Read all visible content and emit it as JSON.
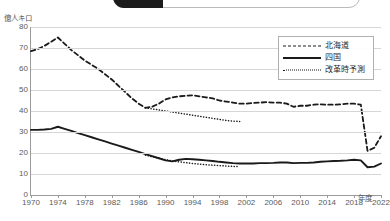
{
  "toolbar": {
    "active_chip_label": "",
    "chips": []
  },
  "chart_data": {
    "type": "line",
    "title": "",
    "xlabel": "年度",
    "ylabel": "億人キロ",
    "grid": true,
    "legend_position": "top-right",
    "xlim": [
      1970,
      2022
    ],
    "ylim": [
      0,
      80
    ],
    "yticks": [
      0,
      10,
      20,
      30,
      40,
      50,
      60,
      70,
      80
    ],
    "xticks": [
      1970,
      1974,
      1978,
      1982,
      1986,
      1990,
      1994,
      1998,
      2002,
      2006,
      2010,
      2014,
      2018,
      2022
    ],
    "series": [
      {
        "name": "北海道",
        "style": "dashed",
        "color": "#1a1a1a",
        "x": [
          1970,
          1971,
          1972,
          1973,
          1974,
          1975,
          1976,
          1977,
          1978,
          1979,
          1980,
          1981,
          1982,
          1983,
          1984,
          1985,
          1986,
          1987,
          1988,
          1989,
          1990,
          1991,
          1992,
          1993,
          1994,
          1995,
          1996,
          1997,
          1998,
          1999,
          2000,
          2001,
          2002,
          2003,
          2004,
          2005,
          2006,
          2007,
          2008,
          2009,
          2010,
          2011,
          2012,
          2013,
          2014,
          2015,
          2016,
          2017,
          2018,
          2019,
          2020,
          2021,
          2022
        ],
        "values": [
          68.5,
          69.5,
          71.0,
          73.0,
          75.0,
          72.0,
          69.0,
          66.5,
          64.0,
          62.0,
          60.0,
          57.5,
          55.0,
          52.0,
          49.0,
          46.0,
          43.5,
          41.5,
          42.0,
          43.5,
          45.5,
          46.5,
          47.0,
          47.2,
          47.5,
          47.0,
          46.5,
          46.0,
          45.0,
          44.5,
          44.0,
          43.5,
          43.5,
          43.8,
          44.0,
          44.2,
          44.0,
          44.0,
          43.5,
          42.0,
          42.5,
          42.5,
          43.0,
          43.2,
          43.0,
          43.0,
          43.2,
          43.5,
          43.5,
          43.0,
          21.0,
          22.5,
          28.0
        ]
      },
      {
        "name": "四国",
        "style": "solid",
        "color": "#1a1a1a",
        "x": [
          1970,
          1971,
          1972,
          1973,
          1974,
          1975,
          1976,
          1977,
          1978,
          1979,
          1980,
          1981,
          1982,
          1983,
          1984,
          1985,
          1986,
          1987,
          1988,
          1989,
          1990,
          1991,
          1992,
          1993,
          1994,
          1995,
          1996,
          1997,
          1998,
          1999,
          2000,
          2001,
          2002,
          2003,
          2004,
          2005,
          2006,
          2007,
          2008,
          2009,
          2010,
          2011,
          2012,
          2013,
          2014,
          2015,
          2016,
          2017,
          2018,
          2019,
          2020,
          2021,
          2022
        ],
        "values": [
          31.0,
          31.0,
          31.2,
          31.5,
          32.5,
          31.5,
          30.5,
          29.5,
          28.5,
          27.5,
          26.5,
          25.5,
          24.5,
          23.5,
          22.5,
          21.5,
          20.5,
          19.5,
          18.5,
          17.5,
          16.5,
          16.0,
          16.8,
          17.2,
          17.0,
          16.8,
          16.5,
          16.2,
          15.8,
          15.5,
          15.2,
          15.0,
          15.0,
          15.0,
          15.2,
          15.2,
          15.3,
          15.5,
          15.5,
          15.2,
          15.3,
          15.3,
          15.5,
          15.8,
          16.0,
          16.2,
          16.3,
          16.5,
          16.8,
          16.5,
          13.2,
          13.5,
          15.0
        ]
      },
      {
        "name": "改革時予測",
        "style": "dotted",
        "color": "#1a1a1a",
        "segments": [
          {
            "for": "北海道",
            "x": [
              1987,
              1988,
              1989,
              1990,
              1991,
              1992,
              1993,
              1994,
              1995,
              1996,
              1997,
              1998,
              1999,
              2000,
              2001
            ],
            "values": [
              41.5,
              41.0,
              40.5,
              40.0,
              39.5,
              39.0,
              38.5,
              38.0,
              37.5,
              37.0,
              36.5,
              36.0,
              35.5,
              35.2,
              35.0
            ]
          },
          {
            "for": "四国",
            "x": [
              1987,
              1988,
              1989,
              1990,
              1991,
              1992,
              1993,
              1994,
              1995,
              1996,
              1997,
              1998,
              1999,
              2000,
              2001
            ],
            "values": [
              19.0,
              18.2,
              17.5,
              16.8,
              16.2,
              15.8,
              15.4,
              15.0,
              14.7,
              14.4,
              14.2,
              14.0,
              13.8,
              13.6,
              13.5
            ]
          }
        ]
      }
    ]
  },
  "legend": {
    "items": [
      {
        "label": "北海道",
        "style": "dashed"
      },
      {
        "label": "四国",
        "style": "solid"
      },
      {
        "label": "改革時予測",
        "style": "dotted"
      }
    ]
  }
}
